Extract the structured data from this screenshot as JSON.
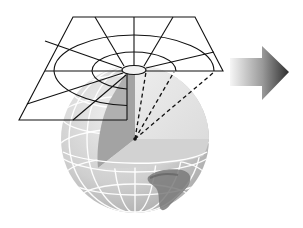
{
  "diagram": {
    "type": "azimuthal-projection-illustration",
    "elements": {
      "projection_plane": {
        "rings": 3,
        "radial_lines": 8,
        "line_color": "#111111"
      },
      "globe": {
        "graticule_color": "#ffffff",
        "cutaway_wedge": true,
        "shading": [
          "#c9c9c9",
          "#a9a9a9",
          "#e4e4e4",
          "#d4d4d4"
        ]
      },
      "projection_lines": {
        "count": 4,
        "style": "dashed",
        "color": "#111111"
      },
      "arrow": {
        "direction": "right",
        "gradient": [
          "#f4f4f4",
          "#3a3a3a"
        ]
      }
    }
  }
}
